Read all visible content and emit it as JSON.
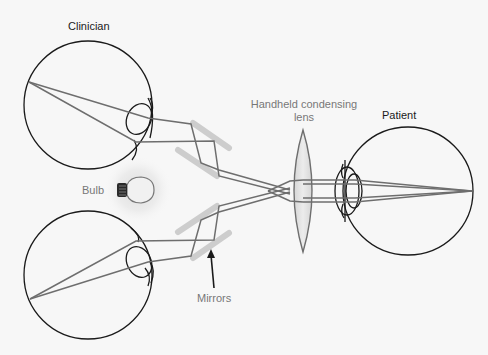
{
  "diagram": {
    "type": "indirect ophthalmoscope optics",
    "labels": {
      "clinician": "Clinician",
      "patient": "Patient",
      "lens_line1": "Handheld condensing",
      "lens_line2": "lens",
      "bulb": "Bulb",
      "mirrors": "Mirrors"
    },
    "colors": {
      "background": "#f7f7f7",
      "outline": "#1a1a1a",
      "ray": "#6e6e6e",
      "mirror": "#cfcfcf",
      "lens_fill": "#dcdcdc",
      "lens_stroke": "#6e6e6e",
      "glow": "#e6e6e6",
      "grey_text": "#777777"
    },
    "components": [
      {
        "id": "clinician-eye-upper",
        "kind": "eye",
        "label": "Clinician"
      },
      {
        "id": "clinician-eye-lower",
        "kind": "eye"
      },
      {
        "id": "bulb",
        "kind": "light-source",
        "label": "Bulb"
      },
      {
        "id": "mirrors",
        "kind": "mirror-set",
        "label": "Mirrors",
        "count": 4
      },
      {
        "id": "condensing-lens",
        "kind": "lens",
        "label": "Handheld condensing lens"
      },
      {
        "id": "patient-eye",
        "kind": "eye",
        "label": "Patient"
      }
    ]
  }
}
